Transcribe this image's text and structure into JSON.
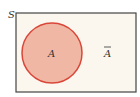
{
  "diagram": {
    "type": "venn",
    "universe_label": "S",
    "set_label": "A",
    "complement_label": "A",
    "complement_bar": true,
    "colors": {
      "universe_fill": "#fbf7ee",
      "universe_stroke": "#444444",
      "set_fill": "#f0b8a4",
      "set_stroke": "#d9473a"
    }
  }
}
